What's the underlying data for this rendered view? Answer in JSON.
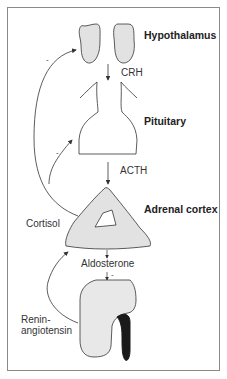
{
  "labels": {
    "hypothalamus": "Hypothalamus",
    "crh": "CRH",
    "pituitary": "Pituitary",
    "acth": "ACTH",
    "adrenal_cortex": "Adrenal cortex",
    "cortisol": "Cortisol",
    "aldosterone": "Aldosterone",
    "renin_line1": "Renin-",
    "renin_line2": "angiotensin"
  },
  "feedback_signs": {
    "cortisol_to_hypothalamus": "-",
    "cortisol_to_pituitary": "-",
    "aldosterone_to_kidney": "-"
  },
  "colors": {
    "organ_fill": "#e2e2e2",
    "organ_stroke": "#333333",
    "kidney_fill": "#e8e8e8",
    "ureter": "#1a1a1a",
    "frame": "#8a8a8a"
  }
}
